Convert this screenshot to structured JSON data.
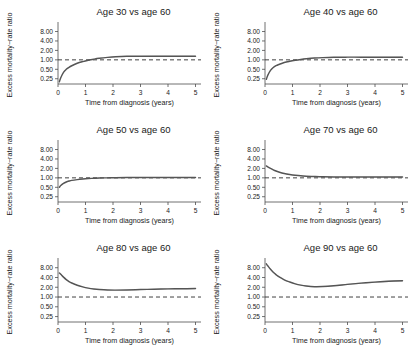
{
  "figure": {
    "background": "#ffffff",
    "curve_color": "#555555",
    "reference_color": "#2b2b2b",
    "axis_color": "#4d4d4d"
  },
  "chart_data": [
    {
      "type": "line",
      "title": "Age 30 vs age 60",
      "xlabel": "Time from diagnosis (years)",
      "ylabel": "Excess mortality−rate ratio",
      "xlim": [
        0,
        5.2
      ],
      "ylim": [
        0.17,
        12
      ],
      "yscale": "log",
      "xticks": [
        0,
        1,
        2,
        3,
        4,
        5
      ],
      "xticklabels": [
        "0",
        "1",
        "2",
        "3",
        "4",
        "5"
      ],
      "yticks": [
        0.25,
        0.5,
        1.0,
        2.0,
        4.0,
        8.0
      ],
      "yticklabels": [
        "0.25",
        "0.50",
        "1.00",
        "2.00",
        "4.00",
        "8.00"
      ],
      "grid": false,
      "legend": "none",
      "reference_line": 1.0,
      "x": [
        0.05,
        0.1,
        0.2,
        0.3,
        0.4,
        0.5,
        0.7,
        0.9,
        1.1,
        1.3,
        1.5,
        1.8,
        2.1,
        2.5,
        3.0,
        3.5,
        4.0,
        4.5,
        5.0
      ],
      "values": [
        0.2,
        0.27,
        0.4,
        0.5,
        0.58,
        0.65,
        0.78,
        0.88,
        0.97,
        1.05,
        1.12,
        1.2,
        1.26,
        1.3,
        1.31,
        1.31,
        1.31,
        1.31,
        1.31
      ],
      "band_halfwidth": [
        0.02,
        0.02,
        0.02,
        0.02,
        0.02,
        0.02,
        0.02,
        0.02,
        0.02,
        0.02,
        0.02,
        0.02,
        0.02,
        0.02,
        0.02,
        0.025,
        0.03,
        0.035,
        0.04
      ]
    },
    {
      "type": "line",
      "title": "Age 40 vs age 60",
      "xlabel": "Time from diagnosis (years)",
      "ylabel": "Excess mortality−rate ratio",
      "xlim": [
        0,
        5.2
      ],
      "ylim": [
        0.17,
        12
      ],
      "yscale": "log",
      "xticks": [
        0,
        1,
        2,
        3,
        4,
        5
      ],
      "xticklabels": [
        "0",
        "1",
        "2",
        "3",
        "4",
        "5"
      ],
      "yticks": [
        0.25,
        0.5,
        1.0,
        2.0,
        4.0,
        8.0
      ],
      "yticklabels": [
        "0.25",
        "0.50",
        "1.00",
        "2.00",
        "4.00",
        "8.00"
      ],
      "grid": false,
      "legend": "none",
      "reference_line": 1.0,
      "x": [
        0.05,
        0.1,
        0.2,
        0.3,
        0.4,
        0.5,
        0.7,
        0.9,
        1.1,
        1.3,
        1.5,
        1.8,
        2.1,
        2.5,
        3.0,
        3.5,
        4.0,
        4.5,
        5.0
      ],
      "values": [
        0.24,
        0.32,
        0.46,
        0.57,
        0.65,
        0.71,
        0.82,
        0.9,
        0.97,
        1.03,
        1.08,
        1.14,
        1.18,
        1.21,
        1.22,
        1.22,
        1.22,
        1.22,
        1.22
      ],
      "band_halfwidth": [
        0.02,
        0.02,
        0.02,
        0.02,
        0.02,
        0.02,
        0.02,
        0.02,
        0.02,
        0.02,
        0.02,
        0.02,
        0.02,
        0.02,
        0.02,
        0.025,
        0.03,
        0.035,
        0.04
      ]
    },
    {
      "type": "line",
      "title": "Age 50 vs age 60",
      "xlabel": "Time from diagnosis (years)",
      "ylabel": "Excess mortality−rate ratio",
      "xlim": [
        0,
        5.2
      ],
      "ylim": [
        0.17,
        12
      ],
      "yscale": "log",
      "xticks": [
        0,
        1,
        2,
        3,
        4,
        5
      ],
      "xticklabels": [
        "0",
        "1",
        "2",
        "3",
        "4",
        "5"
      ],
      "yticks": [
        0.25,
        0.5,
        1.0,
        2.0,
        4.0,
        8.0
      ],
      "yticklabels": [
        "0.25",
        "0.50",
        "1.00",
        "2.00",
        "4.00",
        "8.00"
      ],
      "grid": false,
      "legend": "none",
      "reference_line": 1.0,
      "x": [
        0.05,
        0.1,
        0.2,
        0.3,
        0.4,
        0.5,
        0.7,
        0.9,
        1.1,
        1.3,
        1.5,
        1.8,
        2.1,
        2.5,
        3.0,
        3.5,
        4.0,
        4.5,
        5.0
      ],
      "values": [
        0.5,
        0.57,
        0.67,
        0.74,
        0.79,
        0.83,
        0.88,
        0.92,
        0.95,
        0.97,
        0.99,
        1.0,
        1.01,
        1.02,
        1.02,
        1.02,
        1.02,
        1.02,
        1.02
      ],
      "band_halfwidth": [
        0.015,
        0.015,
        0.015,
        0.015,
        0.015,
        0.015,
        0.015,
        0.015,
        0.015,
        0.015,
        0.015,
        0.015,
        0.015,
        0.015,
        0.018,
        0.02,
        0.025,
        0.03,
        0.035
      ]
    },
    {
      "type": "line",
      "title": "Age 70 vs age 60",
      "xlabel": "Time from diagnosis (years)",
      "ylabel": "Excess mortality−rate ratio",
      "xlim": [
        0,
        5.2
      ],
      "ylim": [
        0.17,
        12
      ],
      "yscale": "log",
      "xticks": [
        0,
        1,
        2,
        3,
        4,
        5
      ],
      "xticklabels": [
        "0",
        "1",
        "2",
        "3",
        "4",
        "5"
      ],
      "yticks": [
        0.25,
        0.5,
        1.0,
        2.0,
        4.0,
        8.0
      ],
      "yticklabels": [
        "0.25",
        "0.50",
        "1.00",
        "2.00",
        "4.00",
        "8.00"
      ],
      "grid": false,
      "legend": "none",
      "reference_line": 1.0,
      "x": [
        0.05,
        0.1,
        0.2,
        0.3,
        0.4,
        0.5,
        0.7,
        0.9,
        1.1,
        1.3,
        1.5,
        1.8,
        2.1,
        2.5,
        3.0,
        3.5,
        4.0,
        4.5,
        5.0
      ],
      "values": [
        2.4,
        2.25,
        2.0,
        1.8,
        1.65,
        1.54,
        1.38,
        1.28,
        1.21,
        1.16,
        1.13,
        1.1,
        1.08,
        1.07,
        1.06,
        1.06,
        1.06,
        1.06,
        1.06
      ],
      "band_halfwidth": [
        0.025,
        0.022,
        0.02,
        0.018,
        0.018,
        0.016,
        0.015,
        0.015,
        0.015,
        0.015,
        0.015,
        0.015,
        0.015,
        0.016,
        0.018,
        0.022,
        0.026,
        0.03,
        0.035
      ]
    },
    {
      "type": "line",
      "title": "Age 80 vs age 60",
      "xlabel": "Time from diagnosis (years)",
      "ylabel": "Excess mortality−rate ratio",
      "xlim": [
        0,
        5.2
      ],
      "ylim": [
        0.17,
        12
      ],
      "yscale": "log",
      "xticks": [
        0,
        1,
        2,
        3,
        4,
        5
      ],
      "xticklabels": [
        "0",
        "1",
        "2",
        "3",
        "4",
        "5"
      ],
      "yticks": [
        0.25,
        0.5,
        1.0,
        2.0,
        4.0,
        8.0
      ],
      "yticklabels": [
        "0.25",
        "0.50",
        "1.00",
        "2.00",
        "4.00",
        "8.00"
      ],
      "grid": false,
      "legend": "none",
      "reference_line": 1.0,
      "x": [
        0.05,
        0.1,
        0.2,
        0.3,
        0.4,
        0.5,
        0.7,
        0.9,
        1.1,
        1.3,
        1.5,
        1.8,
        2.1,
        2.5,
        3.0,
        3.5,
        4.0,
        4.5,
        5.0
      ],
      "values": [
        5.5,
        5.0,
        4.1,
        3.45,
        3.0,
        2.7,
        2.3,
        2.05,
        1.88,
        1.77,
        1.7,
        1.64,
        1.63,
        1.65,
        1.7,
        1.74,
        1.78,
        1.8,
        1.82
      ],
      "band_halfwidth": [
        0.03,
        0.028,
        0.025,
        0.022,
        0.02,
        0.02,
        0.018,
        0.018,
        0.018,
        0.018,
        0.018,
        0.018,
        0.02,
        0.022,
        0.025,
        0.03,
        0.035,
        0.04,
        0.045
      ]
    },
    {
      "type": "line",
      "title": "Age 90 vs age 60",
      "xlabel": "Time from diagnosis (years)",
      "ylabel": "Excess mortality−rate ratio",
      "xlim": [
        0,
        5.2
      ],
      "ylim": [
        0.17,
        12
      ],
      "yscale": "log",
      "xticks": [
        0,
        1,
        2,
        3,
        4,
        5
      ],
      "xticklabels": [
        "0",
        "1",
        "2",
        "3",
        "4",
        "5"
      ],
      "yticks": [
        0.25,
        0.5,
        1.0,
        2.0,
        4.0,
        8.0
      ],
      "yticklabels": [
        "0.25",
        "0.50",
        "1.00",
        "2.00",
        "4.00",
        "8.00"
      ],
      "grid": false,
      "legend": "none",
      "reference_line": 1.0,
      "x": [
        0.05,
        0.1,
        0.2,
        0.3,
        0.4,
        0.5,
        0.7,
        0.9,
        1.1,
        1.3,
        1.5,
        1.8,
        2.1,
        2.5,
        3.0,
        3.5,
        4.0,
        4.5,
        5.0
      ],
      "values": [
        10.5,
        9.2,
        7.2,
        5.8,
        4.9,
        4.25,
        3.4,
        2.9,
        2.55,
        2.32,
        2.18,
        2.08,
        2.1,
        2.22,
        2.45,
        2.68,
        2.88,
        3.05,
        3.18
      ],
      "band_halfwidth": [
        0.04,
        0.038,
        0.035,
        0.032,
        0.03,
        0.028,
        0.026,
        0.025,
        0.025,
        0.025,
        0.026,
        0.028,
        0.03,
        0.033,
        0.038,
        0.043,
        0.048,
        0.053,
        0.058
      ]
    }
  ]
}
